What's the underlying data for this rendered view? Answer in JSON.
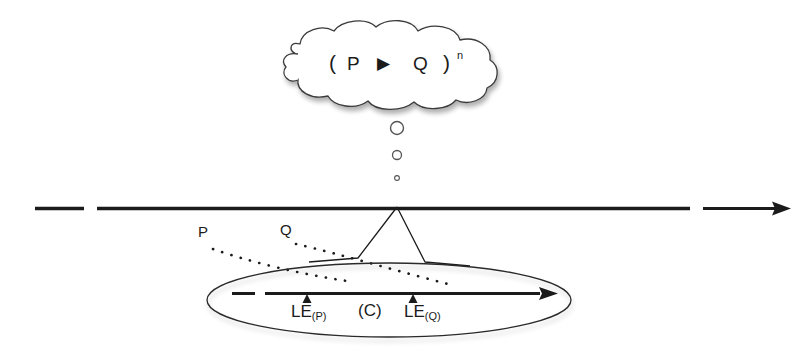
{
  "diagram": {
    "background_color": "#ffffff",
    "stroke_color": "#1b1b1b",
    "cloud": {
      "name": "abstract-pattern-cloud",
      "open_paren": "(",
      "left_term": "P",
      "operator_icon": "right-triangle-icon",
      "operator_symbol": "▶",
      "right_term": "Q",
      "close_paren": ")",
      "exponent": "n"
    },
    "thought_bubbles": [
      {
        "name": "thought-bubble-large",
        "size": 13
      },
      {
        "name": "thought-bubble-medium",
        "size": 9
      },
      {
        "name": "thought-bubble-small",
        "size": 5
      }
    ],
    "main_timeline": {
      "name": "main-timeline",
      "style": "dashed",
      "arrowhead": "right",
      "y": 208
    },
    "zoom_cone": {
      "name": "zoom-cone",
      "apex_x": 397,
      "apex_y": 208
    },
    "trace_lines": [
      {
        "name": "trace-line-p",
        "label": "P",
        "style": "dotted"
      },
      {
        "name": "trace-line-q",
        "label": "Q",
        "style": "dotted"
      }
    ],
    "detail_ellipse": {
      "name": "detail-ellipse",
      "inner_timeline": {
        "name": "inner-timeline",
        "style": "dashed",
        "arrowhead": "right"
      },
      "markers": [
        {
          "name": "marker-le-p",
          "label_main": "LE",
          "label_sub": "(P)",
          "x": 307
        },
        {
          "name": "marker-le-q",
          "label_main": "LE",
          "label_sub": "(Q)",
          "x": 413
        }
      ],
      "context_label": "(C)"
    }
  }
}
